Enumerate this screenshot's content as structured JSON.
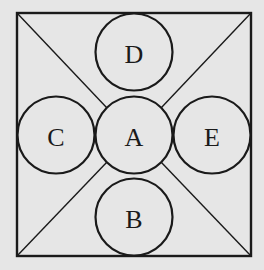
{
  "diagram": {
    "type": "geometry-figure",
    "colors": {
      "background": "#e6e6e6",
      "ink": "#1a1a1a"
    },
    "square": {
      "x": 17,
      "y": 13,
      "width": 234,
      "height": 243
    },
    "circles": [
      {
        "label": "A",
        "cx": 134,
        "cy": 135,
        "r": 38.5
      },
      {
        "label": "B",
        "cx": 134,
        "cy": 217,
        "r": 38.5
      },
      {
        "label": "C",
        "cx": 56,
        "cy": 135,
        "r": 38.5
      },
      {
        "label": "D",
        "cx": 134,
        "cy": 52,
        "r": 38.5
      },
      {
        "label": "E",
        "cx": 212,
        "cy": 135,
        "r": 38.5
      }
    ],
    "labels": {
      "A": "A",
      "B": "B",
      "C": "C",
      "D": "D",
      "E": "E"
    }
  }
}
